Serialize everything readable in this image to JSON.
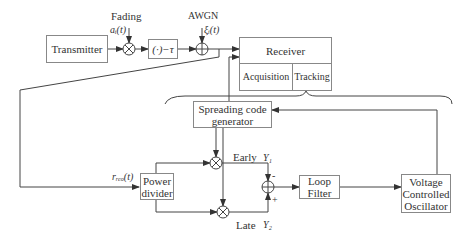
{
  "diagram": {
    "blocks": {
      "transmitter": "Transmitter",
      "delay": "(·)−τ",
      "receiver": "Receiver",
      "acquisition": "Acquisition",
      "tracking": "Tracking",
      "spreading_code_line1": "Spreading code",
      "spreading_code_line2": "generator",
      "power_divider_line1": "Power",
      "power_divider_line2": "divider",
      "loop_filter_line1": "Loop",
      "loop_filter_line2": "Filter",
      "vco_line1": "Voltage",
      "vco_line2": "Controlled",
      "vco_line3": "Oscillator"
    },
    "labels": {
      "fading": "Fading",
      "fading_signal": "aᵢ(t)",
      "awgn": "AWGN",
      "noise_signal": "ξᵢ(t)",
      "received_signal": "rᵣₑₒ(t)",
      "early": "Early",
      "late": "Late",
      "y1": "Y₁",
      "y2": "Y₂",
      "minus": "-",
      "plus": "+"
    },
    "colors": {
      "line": "#444444",
      "box_border": "#888888"
    }
  }
}
